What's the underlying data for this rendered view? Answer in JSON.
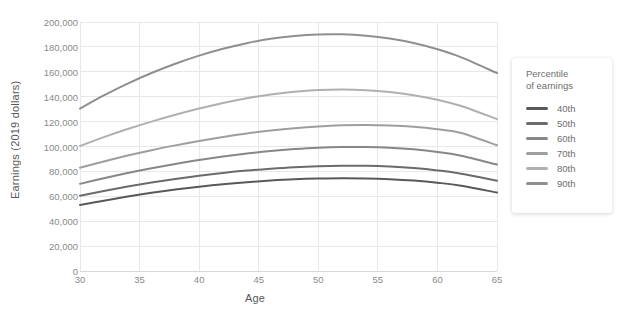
{
  "chart_data": {
    "type": "line",
    "title": "",
    "xlabel": "Age",
    "ylabel": "Earnings (2019 dollars)",
    "xlim": [
      30,
      65
    ],
    "ylim": [
      0,
      200000
    ],
    "grid": true,
    "legend_position": "right",
    "legend_title": "Percentile of earnings",
    "x_ticks": [
      30,
      35,
      40,
      45,
      50,
      55,
      60,
      65
    ],
    "x_tick_labels": [
      "30",
      "35",
      "40",
      "45",
      "50",
      "55",
      "60",
      "65"
    ],
    "y_ticks": [
      0,
      20000,
      40000,
      60000,
      80000,
      100000,
      120000,
      140000,
      160000,
      180000,
      200000
    ],
    "y_tick_labels": [
      "0",
      "20,000",
      "40,000",
      "60,000",
      "80,000",
      "100,000",
      "120,000",
      "140,000",
      "160,000",
      "180,000",
      "200,000"
    ],
    "x": [
      30,
      32,
      34,
      36,
      38,
      40,
      42,
      44,
      46,
      48,
      50,
      52,
      54,
      56,
      58,
      60,
      62,
      65
    ],
    "series": [
      {
        "name": "40th",
        "color": "#595959",
        "values": [
          53000,
          56500,
          59800,
          62800,
          65400,
          67700,
          69700,
          71300,
          72600,
          73600,
          74200,
          74500,
          74300,
          73700,
          72600,
          70900,
          68500,
          63000
        ]
      },
      {
        "name": "50th",
        "color": "#6b6b6b",
        "values": [
          60500,
          64300,
          67800,
          71000,
          73900,
          76500,
          78800,
          80700,
          82200,
          83400,
          84200,
          84600,
          84500,
          83900,
          82700,
          80800,
          78100,
          72500
        ]
      },
      {
        "name": "60th",
        "color": "#878787",
        "values": [
          70000,
          74500,
          78700,
          82500,
          86000,
          89200,
          92000,
          94400,
          96400,
          97900,
          99000,
          99600,
          99600,
          99000,
          97700,
          95600,
          92600,
          85500
        ]
      },
      {
        "name": "70th",
        "color": "#9e9e9e",
        "values": [
          83000,
          88000,
          92700,
          97000,
          100900,
          104500,
          107700,
          110500,
          112800,
          114700,
          116100,
          117000,
          117300,
          116900,
          115800,
          113800,
          110900,
          101000
        ]
      },
      {
        "name": "80th",
        "color": "#b0b0b0",
        "values": [
          100500,
          107500,
          114000,
          120000,
          125500,
          130500,
          135000,
          138800,
          141800,
          144000,
          145300,
          145700,
          145200,
          143700,
          141200,
          137500,
          132500,
          122000
        ]
      },
      {
        "name": "90th",
        "color": "#8f8f8f",
        "values": [
          130500,
          141000,
          150500,
          159000,
          166500,
          173000,
          178500,
          183000,
          186500,
          188800,
          190000,
          190100,
          189000,
          186700,
          183100,
          178100,
          171600,
          159000
        ]
      }
    ]
  },
  "legend": {
    "title_line1": "Percentile",
    "title_line2": "of earnings",
    "items": [
      {
        "label": "40th",
        "color": "#595959"
      },
      {
        "label": "50th",
        "color": "#6b6b6b"
      },
      {
        "label": "60th",
        "color": "#878787"
      },
      {
        "label": "70th",
        "color": "#9e9e9e"
      },
      {
        "label": "80th",
        "color": "#b0b0b0"
      },
      {
        "label": "90th",
        "color": "#8f8f8f"
      }
    ]
  },
  "colors": {
    "grid": "#e8e8e8",
    "axis_text": "#8a8a8a",
    "title_text": "#595959",
    "background": "#ffffff"
  }
}
